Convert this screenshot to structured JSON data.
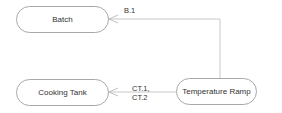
{
  "diagram": {
    "nodes": [
      {
        "id": "batch",
        "label": "Batch"
      },
      {
        "id": "cooking-tank",
        "label": "Cooking Tank"
      },
      {
        "id": "temperature-ramp",
        "label": "Temperature Ramp"
      }
    ],
    "edges": [
      {
        "from": "temperature-ramp",
        "to": "batch",
        "label": "B.1"
      },
      {
        "from": "temperature-ramp",
        "to": "cooking-tank",
        "label_line1": "CT.1,",
        "label_line2": "CT.2"
      }
    ],
    "colors": {
      "line": "#c8c8c8",
      "border": "#a8a8a8",
      "text": "#333333"
    }
  }
}
